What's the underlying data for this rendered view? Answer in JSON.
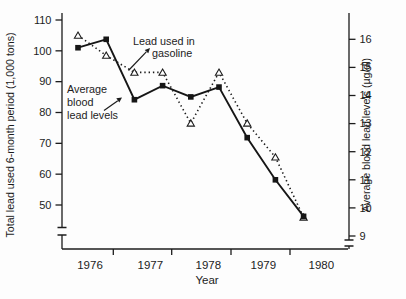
{
  "chart_data": {
    "type": "line",
    "title": "",
    "xlabel": "Year",
    "x_categories": [
      "1976",
      "1977",
      "1978",
      "1979",
      "1980"
    ],
    "x_note_points_per_year": 2,
    "left_axis": {
      "label": "Total lead used 6-month period (1,000 tons)",
      "ticks": [
        110,
        100,
        90,
        80,
        70,
        60,
        50
      ],
      "range": [
        50,
        110
      ],
      "axis_break": true
    },
    "right_axis": {
      "label": "Average blood lead levels (µg/dl)",
      "ticks": [
        16,
        15,
        14,
        13,
        12,
        11,
        10,
        9
      ],
      "range": [
        9,
        16
      ],
      "axis_break": true
    },
    "grid": false,
    "series": [
      {
        "name": "Lead used in gasoline",
        "axis": "left",
        "line_style": "dotted",
        "marker": "open-triangle",
        "color": "#1c1c1c",
        "values": [
          105,
          98.5,
          93,
          93,
          76.5,
          93,
          76.5,
          65.5,
          46
        ]
      },
      {
        "name": "Average blood lead levels",
        "axis": "right",
        "line_style": "solid",
        "marker": "filled-square",
        "color": "#161616",
        "values": [
          15.7,
          16,
          13.85,
          14.35,
          13.95,
          14.3,
          12.5,
          11,
          9.7
        ]
      }
    ],
    "annotations": [
      {
        "lines": [
          "Lead used in",
          "gasoline"
        ]
      },
      {
        "lines": [
          "Average",
          "blood",
          "lead levels"
        ]
      }
    ]
  }
}
